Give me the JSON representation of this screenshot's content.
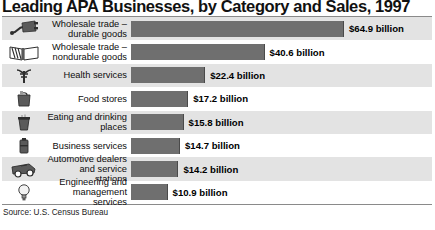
{
  "chart_data": {
    "type": "bar",
    "title": "Leading APA Businesses, by Category and Sales, 1997",
    "orientation": "horizontal",
    "xlabel": "",
    "ylabel": "",
    "xlim": [
      0,
      64.9
    ],
    "grid": false,
    "legend": "none",
    "units": "billion US dollars",
    "categories": [
      "Wholesale trade – durable goods",
      "Wholesale trade – nondurable goods",
      "Health services",
      "Food stores",
      "Eating and drinking places",
      "Business services",
      "Automotive dealers and service stations",
      "Engineering and management services"
    ],
    "values": [
      64.9,
      40.6,
      22.4,
      17.2,
      15.8,
      14.7,
      14.2,
      10.9
    ],
    "value_labels": [
      "$64.9 billion",
      "$40.6 billion",
      "$22.4 billion",
      "$17.2 billion",
      "$15.8 billion",
      "$14.7 billion",
      "$14.2 billion",
      "$10.9 billion"
    ],
    "bar_color": "#6f6f6f",
    "band_color": "#e3e3e3"
  },
  "rows": [
    {
      "line1": "Wholesale trade –",
      "line2": "durable goods",
      "value_label": "$64.9 billion",
      "value": 64.9,
      "icon": "electric-plug-icon"
    },
    {
      "line1": "Wholesale trade –",
      "line2": "nondurable goods",
      "value_label": "$40.6 billion",
      "value": 40.6,
      "icon": "open-book-icon"
    },
    {
      "line1": "Health services",
      "line2": "",
      "value_label": "$22.4 billion",
      "value": 22.4,
      "icon": "caduceus-icon"
    },
    {
      "line1": "Food stores",
      "line2": "",
      "value_label": "$17.2 billion",
      "value": 17.2,
      "icon": "grocery-bag-icon"
    },
    {
      "line1": "Eating and drinking",
      "line2": "places",
      "value_label": "$15.8 billion",
      "value": 15.8,
      "icon": "coffee-cup-icon"
    },
    {
      "line1": "Business services",
      "line2": "",
      "value_label": "$14.7 billion",
      "value": 14.7,
      "icon": "briefcase-icon"
    },
    {
      "line1": "Automotive dealers",
      "line2": "and service stations",
      "value_label": "$14.2 billion",
      "value": 14.2,
      "icon": "car-wrench-icon"
    },
    {
      "line1": "Engineering and",
      "line2": "management services",
      "value_label": "$10.9 billion",
      "value": 10.9,
      "icon": "lightbulb-icon"
    }
  ],
  "source": {
    "text": "Source: U.S. Census Bureau"
  }
}
